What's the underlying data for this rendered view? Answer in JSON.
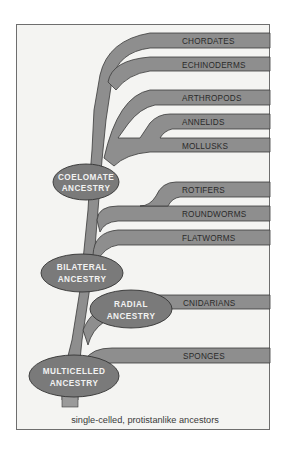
{
  "diagram": {
    "type": "phylogenetic-tree",
    "branches": [
      {
        "id": "chordates",
        "label": "CHORDATES"
      },
      {
        "id": "echinoderms",
        "label": "ECHINODERMS"
      },
      {
        "id": "arthropods",
        "label": "ARTHROPODS"
      },
      {
        "id": "annelids",
        "label": "ANNELIDS"
      },
      {
        "id": "mollusks",
        "label": "MOLLUSKS"
      },
      {
        "id": "rotifers",
        "label": "ROTIFERS"
      },
      {
        "id": "roundworms",
        "label": "ROUNDWORMS"
      },
      {
        "id": "flatworms",
        "label": "FLATWORMS"
      },
      {
        "id": "cnidarians",
        "label": "CNIDARIANS"
      },
      {
        "id": "sponges",
        "label": "SPONGES"
      }
    ],
    "nodes": [
      {
        "id": "coelomate",
        "line1": "COELOMATE",
        "line2": "ANCESTRY"
      },
      {
        "id": "bilateral",
        "line1": "BILATERAL",
        "line2": "ANCESTRY"
      },
      {
        "id": "radial",
        "line1": "RADIAL",
        "line2": "ANCESTRY"
      },
      {
        "id": "multicelled",
        "line1": "MULTICELLED",
        "line2": "ANCESTRY"
      }
    ],
    "caption": "single-celled, protistanlike ancestors",
    "colors": {
      "branch_fill": "#8e8e8e",
      "node_fill": "#7a7a7a",
      "background": "#f4f4f2",
      "outline": "#3a3a3a"
    }
  }
}
